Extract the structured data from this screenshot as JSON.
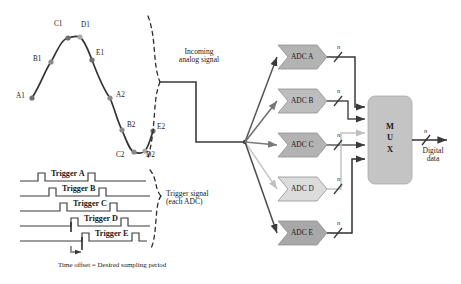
{
  "waveform": {
    "name": "incoming-analog-waveform",
    "stroke": "#333333",
    "sample_dot_color": "#8a8a8a",
    "samples": [
      {
        "id": "A1",
        "x": 32,
        "y": 98,
        "label_x": 16,
        "label_y": 93,
        "dot": true
      },
      {
        "id": "B1",
        "x": 51,
        "y": 62,
        "label_x": 33,
        "label_y": 57,
        "dot": true
      },
      {
        "id": "C1",
        "x": 68,
        "y": 38,
        "label_x": 54,
        "label_y": 21,
        "dot": true
      },
      {
        "id": "D1",
        "x": 80,
        "y": 37,
        "label_x": 81,
        "label_y": 22,
        "dot": true
      },
      {
        "id": "E1",
        "x": 92,
        "y": 60,
        "label_x": 96,
        "label_y": 51,
        "dot": true
      },
      {
        "id": "A2",
        "x": 110,
        "y": 98,
        "label_x": 116,
        "label_y": 93,
        "dot": true
      },
      {
        "id": "B2",
        "x": 122,
        "y": 130,
        "label_x": 127,
        "label_y": 123,
        "dot": true
      },
      {
        "id": "C2",
        "x": 134,
        "y": 152,
        "label_x": 117,
        "label_y": 151,
        "dot": true
      },
      {
        "id": "D2",
        "x": 145,
        "y": 151,
        "label_x": 146,
        "label_y": 151,
        "dot": true
      },
      {
        "id": "E2",
        "x": 153,
        "y": 131,
        "label_x": 156,
        "label_y": 125,
        "dot": true
      }
    ]
  },
  "braces": {
    "analog_brace_name": "analog-signal-brace",
    "trigger_brace_name": "trigger-signal-brace"
  },
  "middle_labels": {
    "analog": {
      "line1": "Incoming",
      "line2": "analog signal",
      "x": 183,
      "y": 53
    },
    "trigger": {
      "line1": "Trigger signal",
      "line2": "(each ADC)",
      "x": 170,
      "y": 194
    }
  },
  "triggers": {
    "lines": [
      {
        "label": "Trigger A",
        "baseline_y": 181,
        "offset": 0,
        "label_x": 50,
        "label_y": 171
      },
      {
        "label": "Trigger B",
        "baseline_y": 196,
        "offset": 11,
        "label_x": 61,
        "label_y": 186
      },
      {
        "label": "Trigger C",
        "baseline_y": 211,
        "offset": 22,
        "label_x": 72,
        "label_y": 201
      },
      {
        "label": "Trigger D",
        "baseline_y": 226,
        "offset": 33,
        "label_x": 83,
        "label_y": 216
      },
      {
        "label": "Trigger E",
        "baseline_y": 241,
        "offset": 44,
        "label_x": 94,
        "label_y": 231
      }
    ],
    "caption": "Time offset = Desired sampling period",
    "caption_x": 58,
    "caption_y": 263
  },
  "adcs": [
    {
      "label": "ADC A",
      "x": 282,
      "y": 45,
      "bus": "n",
      "arrow_color": "#555555"
    },
    {
      "label": "ADC B",
      "x": 282,
      "y": 89,
      "bus": "n",
      "arrow_color": "#6e6e6e"
    },
    {
      "label": "ADC C",
      "x": 282,
      "y": 133,
      "bus": "n",
      "arrow_color": "#7a7a7a"
    },
    {
      "label": "ADC D",
      "x": 282,
      "y": 177,
      "bus": "n",
      "arrow_color": "#c8c8c8"
    },
    {
      "label": "ADC E",
      "x": 282,
      "y": 221,
      "bus": "n",
      "arrow_color": "#4a4a4a"
    }
  ],
  "mux": {
    "label_chars": [
      "M",
      "U",
      "X"
    ],
    "label": "M U X",
    "x": 368,
    "y": 96,
    "width": 44,
    "height": 88,
    "fill": "#c4c4c4"
  },
  "output": {
    "bus": "n",
    "line1": "Digital",
    "line2": "data",
    "x": 424,
    "y": 152
  },
  "fanout": {
    "x": 245,
    "y": 142
  }
}
